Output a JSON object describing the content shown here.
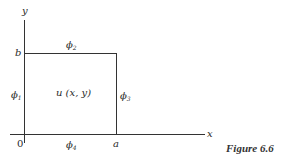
{
  "figure": {
    "caption": "Figure 6.6",
    "axes": {
      "x_label": "x",
      "y_label": "y",
      "origin": "0"
    },
    "ticks": {
      "x_end": "a",
      "y_end": "b"
    },
    "region_label": "u (x, y)",
    "boundaries": {
      "left": {
        "sym": "ϕ",
        "sub": "1"
      },
      "top": {
        "sym": "ϕ",
        "sub": "2"
      },
      "right": {
        "sym": "ϕ",
        "sub": "3"
      },
      "bottom": {
        "sym": "ϕ",
        "sub": "4"
      }
    }
  }
}
